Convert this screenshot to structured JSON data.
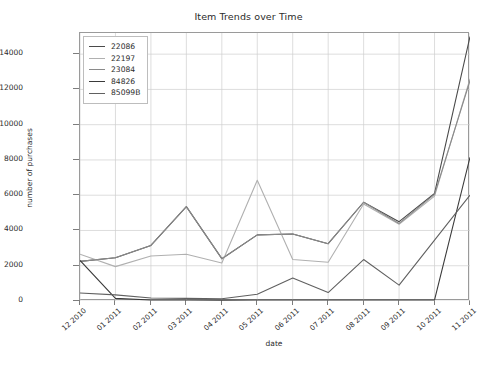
{
  "figure": {
    "title": "Item Trends over Time",
    "background": "#ffffff",
    "plot_border": "#9a9a9a",
    "grid_color": "#cfcfcf"
  },
  "axes": {
    "xlabel": "date",
    "ylabel": "number of purchases",
    "yticks": [
      "0",
      "2000",
      "4000",
      "6000",
      "8000",
      "10000",
      "12000",
      "14000"
    ],
    "xticks": [
      "12 2010",
      "01 2011",
      "02 2011",
      "03 2011",
      "04 2011",
      "05 2011",
      "06 2011",
      "07 2011",
      "08 2011",
      "09 2011",
      "10 2011",
      "11 2011"
    ]
  },
  "legend": {
    "position": "upper-left",
    "items": [
      {
        "label": "22086",
        "color": "#4a4a4a"
      },
      {
        "label": "22197",
        "color": "#b0b0b0"
      },
      {
        "label": "23084",
        "color": "#8a8a8a"
      },
      {
        "label": "84826",
        "color": "#3a3a3a"
      },
      {
        "label": "85099B",
        "color": "#606060"
      }
    ]
  },
  "chart_data": {
    "type": "line",
    "title": "Item Trends over Time",
    "xlabel": "date",
    "ylabel": "number of purchases",
    "x": [
      "12 2010",
      "01 2011",
      "02 2011",
      "03 2011",
      "04 2011",
      "05 2011",
      "06 2011",
      "07 2011",
      "08 2011",
      "09 2011",
      "10 2011",
      "11 2011"
    ],
    "xlim": [
      0,
      11
    ],
    "ylim": [
      0,
      15200
    ],
    "ytick_values": [
      0,
      2000,
      4000,
      6000,
      8000,
      10000,
      12000,
      14000
    ],
    "grid": true,
    "legend_position": "upper left",
    "series": [
      {
        "name": "22086",
        "color": "#4a4a4a",
        "values": [
          2250,
          2450,
          3150,
          5350,
          2400,
          3750,
          3800,
          3250,
          5600,
          4500,
          6100,
          15000
        ]
      },
      {
        "name": "22197",
        "color": "#b0b0b0",
        "values": [
          2650,
          1950,
          2550,
          2650,
          2150,
          6850,
          2350,
          2200,
          5500,
          4350,
          5950,
          12600
        ]
      },
      {
        "name": "23084",
        "color": "#8a8a8a",
        "values": [
          2250,
          2450,
          3150,
          5350,
          2400,
          3750,
          3800,
          3250,
          5600,
          4400,
          6050,
          12500
        ]
      },
      {
        "name": "84826",
        "color": "#3a3a3a",
        "values": [
          2300,
          150,
          60,
          60,
          50,
          60,
          60,
          60,
          60,
          60,
          60,
          8150
        ]
      },
      {
        "name": "85099B",
        "color": "#606060",
        "values": [
          450,
          350,
          170,
          150,
          130,
          380,
          1300,
          480,
          2350,
          900,
          3450,
          6000
        ]
      }
    ]
  }
}
